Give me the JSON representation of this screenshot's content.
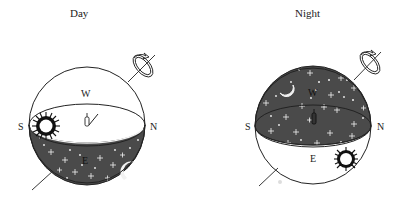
{
  "diagram": {
    "panels": [
      {
        "title": "Day",
        "labels": {
          "south": "S",
          "north": "N",
          "west": "W",
          "east": "E"
        },
        "sky_above_horizon": "light",
        "sky_below_horizon": "dark-starry",
        "objects": [
          "sun-above-horizon",
          "moon-below-horizon",
          "observer",
          "rotation-axis"
        ]
      },
      {
        "title": "Night",
        "labels": {
          "south": "S",
          "north": "N",
          "west": "W",
          "east": "E"
        },
        "sky_above_horizon": "dark-starry",
        "sky_below_horizon": "light",
        "objects": [
          "moon-above-horizon",
          "sun-below-horizon",
          "observer",
          "rotation-axis"
        ]
      }
    ],
    "colors": {
      "line": "#222222",
      "night_sky": "#4a4a4a",
      "star": "#f2f2f2",
      "background": "#ffffff"
    }
  }
}
